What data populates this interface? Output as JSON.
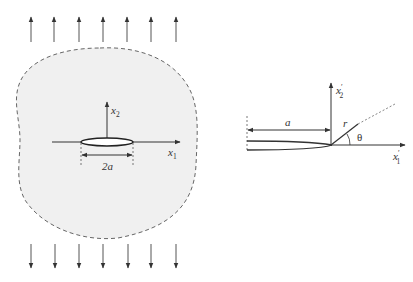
{
  "figure": {
    "left_panel": {
      "description": "Infinite plate with central crack of length 2a under remote tensile stress",
      "axis_x": {
        "label": "x",
        "subscript": "1"
      },
      "axis_y": {
        "label": "x",
        "subscript": "2"
      },
      "crack_length_label": "2a",
      "top_arrow_count": 7,
      "bottom_arrow_count": 7,
      "region_fill": "#f0f0f0",
      "boundary_style": "dashed"
    },
    "right_panel": {
      "description": "Crack tip coordinate system",
      "axis_x": {
        "label": "x",
        "prime": "′",
        "subscript": "1"
      },
      "axis_y": {
        "label": "x",
        "prime": "′",
        "subscript": "2"
      },
      "crack_length_label": "a",
      "radius_label": "r",
      "angle_label": "θ"
    },
    "colors": {
      "line": "#333333",
      "dash": "#666666",
      "fill": "#f0f0f0"
    }
  }
}
